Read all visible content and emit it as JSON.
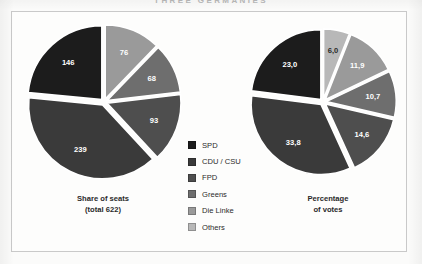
{
  "running_head": "THREE GERMANIES",
  "legend": {
    "items": [
      {
        "label": "SPD",
        "color": "#1c1c1c"
      },
      {
        "label": "CDU / CSU",
        "color": "#3a3a3a"
      },
      {
        "label": "FPD",
        "color": "#4e4e4e"
      },
      {
        "label": "Greens",
        "color": "#6e6e6e"
      },
      {
        "label": "Die Linke",
        "color": "#9a9a9a"
      },
      {
        "label": "Others",
        "color": "#b8b8b8"
      }
    ]
  },
  "charts": {
    "left": {
      "caption_line1": "Share of seats",
      "caption_line2": "(total 622)"
    },
    "right": {
      "caption_line1": "Percentage",
      "caption_line2": "of votes"
    }
  },
  "chart_data": [
    {
      "type": "pie",
      "title": "Share of seats (total 622)",
      "unit": "seats",
      "total": 622,
      "exploded": true,
      "start_angle_deg": 0,
      "direction": "clockwise",
      "categories": [
        "Die Linke",
        "Greens",
        "FPD",
        "CDU / CSU",
        "SPD"
      ],
      "values": [
        76,
        68,
        93,
        239,
        146
      ],
      "labels": [
        "76",
        "68",
        "93",
        "239",
        "146"
      ],
      "colors": [
        "#9a9a9a",
        "#6e6e6e",
        "#4e4e4e",
        "#3a3a3a",
        "#1c1c1c"
      ],
      "legend_position": "center"
    },
    {
      "type": "pie",
      "title": "Percentage of votes",
      "unit": "percent",
      "total": 100.0,
      "exploded": true,
      "start_angle_deg": 0,
      "direction": "clockwise",
      "categories": [
        "Others",
        "Die Linke",
        "Greens",
        "FPD",
        "CDU / CSU",
        "SPD"
      ],
      "values": [
        6.0,
        11.9,
        10.7,
        14.6,
        33.8,
        23.0
      ],
      "labels": [
        "6,0",
        "11,9",
        "10,7",
        "14,6",
        "33,8",
        "23,0"
      ],
      "colors": [
        "#b8b8b8",
        "#9a9a9a",
        "#6e6e6e",
        "#4e4e4e",
        "#3a3a3a",
        "#1c1c1c"
      ],
      "legend_position": "center"
    }
  ]
}
